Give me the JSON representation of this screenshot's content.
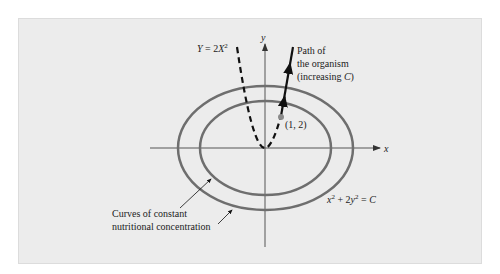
{
  "diagram": {
    "axes": {
      "x_label": "x",
      "y_label": "y"
    },
    "parabola": {
      "label": "Y = 2X²",
      "label_parts": {
        "y": "Y",
        "eq": " = 2",
        "x": "X",
        "exp": "2"
      },
      "equation": "y = 2x^2",
      "style": "dashed"
    },
    "organism_path": {
      "label_lines": [
        "Path of",
        "the organism",
        "(increasing C)"
      ],
      "line3_parts": {
        "pre": "(increasing ",
        "c": "C",
        "post": ")"
      }
    },
    "point": {
      "label": "(1, 2)",
      "x": 1,
      "y": 2,
      "color": "#8a8a8a"
    },
    "level_curves": {
      "equation_label": "x² + 2y² = C",
      "eq_parts": {
        "x": "x",
        "e1": "2",
        "mid": " + 2",
        "y": "y",
        "e2": "2",
        "rhs": " = ",
        "c": "C"
      },
      "caption_lines": [
        "Curves of constant",
        "nutritional concentration"
      ],
      "color": "#6e6e6e",
      "count": 2
    },
    "colors": {
      "panel_bg": "#ececec",
      "axis": "#555555",
      "ink": "#111111"
    }
  }
}
